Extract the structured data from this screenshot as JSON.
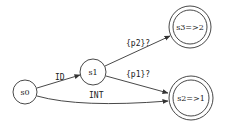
{
  "diagram": {
    "type": "finite-state-automaton",
    "nodes": [
      {
        "id": "s0",
        "label": "s0",
        "accepting": false
      },
      {
        "id": "s1",
        "label": "s1",
        "accepting": false
      },
      {
        "id": "s3",
        "label": "s3=>2",
        "accepting": true
      },
      {
        "id": "s2",
        "label": "s2=>1",
        "accepting": true
      }
    ],
    "edges": [
      {
        "from": "s0",
        "to": "s1",
        "label": "ID"
      },
      {
        "from": "s0",
        "to": "s2",
        "label": "INT"
      },
      {
        "from": "s1",
        "to": "s3",
        "label": "{p2}?"
      },
      {
        "from": "s1",
        "to": "s2",
        "label": "{p1}?"
      }
    ]
  }
}
